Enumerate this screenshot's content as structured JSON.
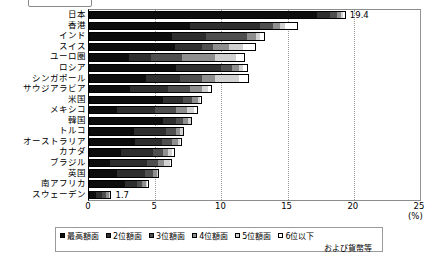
{
  "top": {
    "box_label": "",
    "caption": ""
  },
  "axis": {
    "ticks": [
      "0",
      "5",
      "10",
      "15",
      "20",
      "25"
    ],
    "unit": "(%)",
    "xmin": 0,
    "xmax": 25
  },
  "legend": {
    "items": [
      {
        "label": "最高額面",
        "color": "#0d0d0d"
      },
      {
        "label": "2位額面",
        "color": "#2e2e2e"
      },
      {
        "label": "3位額面",
        "color": "#4f4f4f"
      },
      {
        "label": "4位額面",
        "color": "#8f8f8f"
      },
      {
        "label": "5位額面",
        "color": "#d2d2d2"
      },
      {
        "label": "6位以下",
        "color": "#ffffff"
      }
    ],
    "continuation": "および貨幣等"
  },
  "chart_data": {
    "type": "bar",
    "orientation": "horizontal",
    "stacked": true,
    "title": "",
    "xlabel": "(%)",
    "ylabel": "",
    "xlim": [
      0,
      25
    ],
    "grid": true,
    "legend_position": "bottom",
    "categories": [
      "日本",
      "香港",
      "インド",
      "スイス",
      "ユーロ圏",
      "ロシア",
      "シンガポール",
      "サウジアラビア",
      "米国",
      "メキシコ",
      "韓国",
      "トルコ",
      "オーストラリア",
      "カナダ",
      "ブラジル",
      "英国",
      "南アフリカ",
      "スウェーデン"
    ],
    "series": [
      {
        "name": "最高額面",
        "values": [
          17.2,
          7.6,
          6.3,
          6.5,
          3.0,
          6.6,
          4.3,
          3.1,
          5.6,
          2.1,
          5.6,
          3.4,
          3.5,
          2.4,
          1.6,
          2.1,
          2.7,
          0.5
        ]
      },
      {
        "name": "2位額面",
        "values": [
          1.0,
          5.3,
          2.5,
          2.0,
          1.7,
          3.4,
          2.6,
          2.9,
          1.5,
          2.9,
          1.0,
          2.4,
          2.0,
          2.4,
          2.8,
          2.1,
          0.9,
          0.5
        ]
      },
      {
        "name": "3位額面",
        "values": [
          0.5,
          1.0,
          3.1,
          0.9,
          2.3,
          0.8,
          1.6,
          1.6,
          0.7,
          1.6,
          0.5,
          0.8,
          0.8,
          0.8,
          0.8,
          0.6,
          0.4,
          0.3
        ]
      },
      {
        "name": "4位額面",
        "values": [
          0.3,
          0.5,
          0.7,
          1.2,
          2.5,
          0.5,
          1.0,
          0.9,
          0.4,
          0.8,
          0.4,
          0.3,
          0.4,
          0.4,
          0.5,
          0.3,
          0.3,
          0.2
        ]
      },
      {
        "name": "5位額面",
        "values": [
          0.2,
          0.4,
          0.3,
          1.0,
          1.6,
          0.3,
          1.8,
          0.5,
          0.2,
          0.5,
          0.2,
          0.2,
          0.2,
          0.3,
          0.4,
          0.1,
          0.1,
          0.1
        ]
      },
      {
        "name": "6位以下および貨幣等",
        "values": [
          0.2,
          1.0,
          0.4,
          1.0,
          0.7,
          0.4,
          0.8,
          0.3,
          0.1,
          0.3,
          0.1,
          0.1,
          0.1,
          0.2,
          0.2,
          0.1,
          0.1,
          0.1
        ]
      }
    ],
    "totals": [
      19.4,
      15.8,
      13.3,
      12.6,
      11.8,
      12.0,
      12.1,
      9.3,
      8.5,
      8.2,
      7.8,
      7.2,
      7.0,
      6.5,
      6.3,
      5.3,
      4.5,
      1.7
    ],
    "value_labels": [
      {
        "category": "日本",
        "text": "19.4"
      },
      {
        "category": "スウェーデン",
        "text": "1.7"
      }
    ]
  }
}
